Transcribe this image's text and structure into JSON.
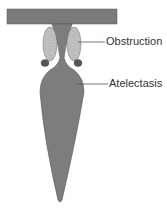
{
  "diagram": {
    "labels": {
      "obstruction": "Obstruction",
      "atelectasis": "Atelectasis"
    },
    "colors": {
      "airway": "#7a7a7a",
      "obstruction": "#b8b8b8",
      "leader": "#555555",
      "text": "#333333"
    }
  }
}
